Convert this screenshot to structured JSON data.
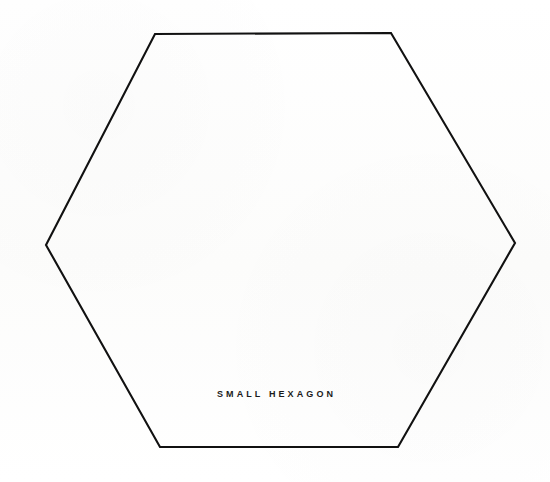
{
  "figure": {
    "name": "small-hexagon-diagram",
    "caption": "SMALL HEXAGON",
    "background_color": "#fdfdfc",
    "stroke_color": "#111111",
    "stroke_width_px": 2.1,
    "canvas": {
      "width": 550,
      "height": 482
    },
    "shape": {
      "type": "hexagon",
      "sides": 6,
      "orientation": "flat-top",
      "filled": false,
      "vertices": [
        {
          "label": "top-left",
          "x": 155,
          "y": 34
        },
        {
          "label": "top-right",
          "x": 391,
          "y": 33
        },
        {
          "label": "right",
          "x": 515,
          "y": 243
        },
        {
          "label": "bottom-right",
          "x": 398,
          "y": 447
        },
        {
          "label": "bottom-left",
          "x": 160,
          "y": 447
        },
        {
          "label": "left",
          "x": 46,
          "y": 245
        }
      ],
      "path": "M 155 34 L 391 33 L 515 243 L 398 447 L 160 447 L 46 245 Z"
    },
    "caption_position": {
      "x": 278,
      "y": 396
    }
  }
}
